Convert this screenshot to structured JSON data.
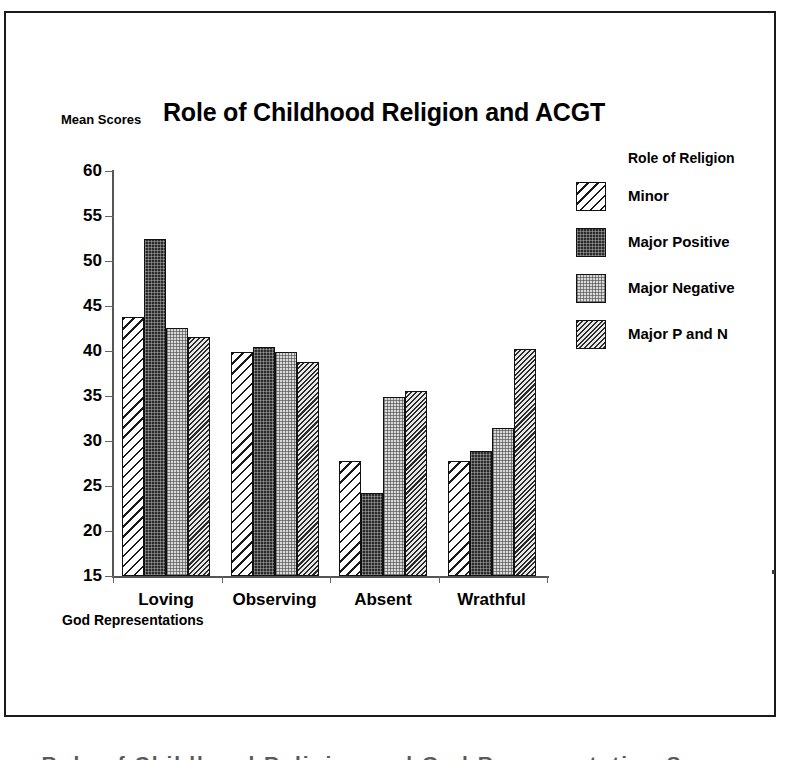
{
  "chart_data": {
    "type": "bar",
    "title": "Role of Childhood Religion and ACGT",
    "xlabel": "God Representations",
    "ylabel": "Mean Scores",
    "legend_title": "Role of Religion",
    "legend_position": "right",
    "grid": false,
    "ylim": [
      15,
      60
    ],
    "yticks": [
      15,
      20,
      25,
      30,
      35,
      40,
      45,
      50,
      55,
      60
    ],
    "ytick_labels": [
      "15",
      "20",
      "25",
      "30",
      "35",
      "40",
      "45",
      "50",
      "55",
      "60"
    ],
    "categories": [
      "Loving",
      "Observing",
      "Absent",
      "Wrathful"
    ],
    "series": [
      {
        "name": "Minor",
        "pattern": "diagonal-hatch-white",
        "color": "#ffffff",
        "values": [
          43.8,
          39.9,
          27.8,
          27.8
        ]
      },
      {
        "name": "Major Positive",
        "pattern": "dense-dot-dark",
        "color": "#2b2b2b",
        "values": [
          52.4,
          40.4,
          24.2,
          28.9
        ]
      },
      {
        "name": "Major Negative",
        "pattern": "fine-dot-light",
        "color": "#d8d8d8",
        "values": [
          42.6,
          39.9,
          34.9,
          31.4
        ]
      },
      {
        "name": "Major P and N",
        "pattern": "dense-diagonal-gray",
        "color": "#b9b9b9",
        "values": [
          41.6,
          38.8,
          35.6,
          40.2
        ]
      }
    ]
  },
  "figure": {
    "border_color": "#1a1a1a",
    "background": "#ffffff"
  },
  "caption_clipped": "Role of Childhood Religion and God Representation Scores"
}
